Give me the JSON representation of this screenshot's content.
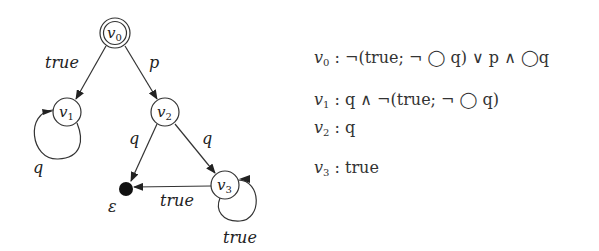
{
  "diagram": {
    "type": "automaton",
    "nodes": [
      {
        "id": "v0",
        "label": "v",
        "sub": "0",
        "x": 115,
        "y": 33,
        "r": 15,
        "initial": true
      },
      {
        "id": "v1",
        "label": "v",
        "sub": "1",
        "x": 67,
        "y": 112,
        "r": 14
      },
      {
        "id": "v2",
        "label": "v",
        "sub": "2",
        "x": 165,
        "y": 112,
        "r": 14
      },
      {
        "id": "v3",
        "label": "v",
        "sub": "3",
        "x": 225,
        "y": 185,
        "r": 14
      },
      {
        "id": "eps",
        "label": "ε",
        "x": 126,
        "y": 189,
        "r": 7,
        "accepting_terminal": true
      }
    ],
    "edges": [
      {
        "from": "v0",
        "to": "v1",
        "label": "true"
      },
      {
        "from": "v0",
        "to": "v2",
        "label": "p"
      },
      {
        "from": "v1",
        "to": "v1",
        "label": "q",
        "self_loop": true
      },
      {
        "from": "v2",
        "to": "eps",
        "label": "q"
      },
      {
        "from": "v2",
        "to": "v3",
        "label": "q"
      },
      {
        "from": "v3",
        "to": "eps",
        "label": "true"
      },
      {
        "from": "v3",
        "to": "v3",
        "label": "true",
        "self_loop": true
      }
    ],
    "edge_labels": {
      "v0_v1": "true",
      "v0_v2": "p",
      "v1_loop": "q",
      "v2_eps": "q",
      "v2_v3": "q",
      "v3_eps": "true",
      "v3_loop": "true",
      "eps": "ε"
    },
    "node_labels": {
      "v": "v",
      "s0": "0",
      "s1": "1",
      "s2": "2",
      "s3": "3"
    }
  },
  "formulas": [
    {
      "var": "v",
      "sub": "0",
      "text": ": ¬(true; ¬ ◯ q) ∨ p ∧ ◯q"
    },
    {
      "var": "v",
      "sub": "1",
      "text": ": q ∧ ¬(true; ¬ ◯ q)"
    },
    {
      "var": "v",
      "sub": "2",
      "text": ": q"
    },
    {
      "var": "v",
      "sub": "3",
      "text": ": true"
    }
  ]
}
